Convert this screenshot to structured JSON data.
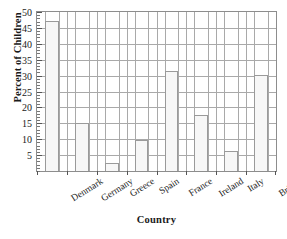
{
  "chart_data": {
    "type": "bar",
    "title": "",
    "xlabel": "Country",
    "ylabel": "Percent of Children",
    "categories": [
      "Denmark",
      "Germany",
      "Greece",
      "Spain",
      "France",
      "Ireland",
      "Italy",
      "Britain"
    ],
    "values": [
      47.3,
      15.0,
      2.6,
      9.8,
      31.6,
      17.6,
      6.3,
      30.3
    ],
    "ylim": [
      0,
      50
    ],
    "ytick_labels": [
      "5",
      "10",
      "15",
      "20",
      "25",
      "30",
      "35",
      "40",
      "45",
      "50"
    ],
    "ytick_values": [
      5,
      10,
      15,
      20,
      25,
      30,
      35,
      40,
      45,
      50
    ],
    "ytick_minor_step": 1,
    "grid": "both",
    "legend": "none",
    "bar_fill_color": "#f7f7f7",
    "bar_edge_color": "#9a9a9a",
    "grid_color": "#a9a9a9",
    "axis_color": "#8d8d8d"
  }
}
